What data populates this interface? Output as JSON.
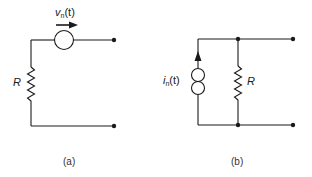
{
  "circuit_a": {
    "caption": "(a)",
    "resistor_label": "R",
    "source_label_main": "v",
    "source_label_sub": "n",
    "source_label_arg": "(t)"
  },
  "circuit_b": {
    "caption": "(b)",
    "resistor_label": "R",
    "source_label_main": "i",
    "source_label_sub": "n",
    "source_label_arg": "(t)"
  },
  "colors": {
    "stroke": "#1a1a1a",
    "background": "#ffffff"
  }
}
